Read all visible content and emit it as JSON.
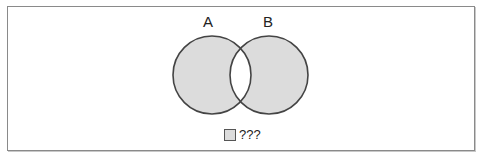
{
  "diagram": {
    "type": "venn",
    "sets": [
      {
        "label": "A",
        "cx": 212,
        "cy": 75,
        "r": 39
      },
      {
        "label": "B",
        "cx": 269,
        "cy": 75,
        "r": 39
      }
    ],
    "shaded_region": "symmetric difference (A only and B only)",
    "colors": {
      "fill": "#dcdcdc",
      "stroke": "#444444",
      "intersection": "#ffffff"
    },
    "legend": {
      "label": "???"
    }
  }
}
